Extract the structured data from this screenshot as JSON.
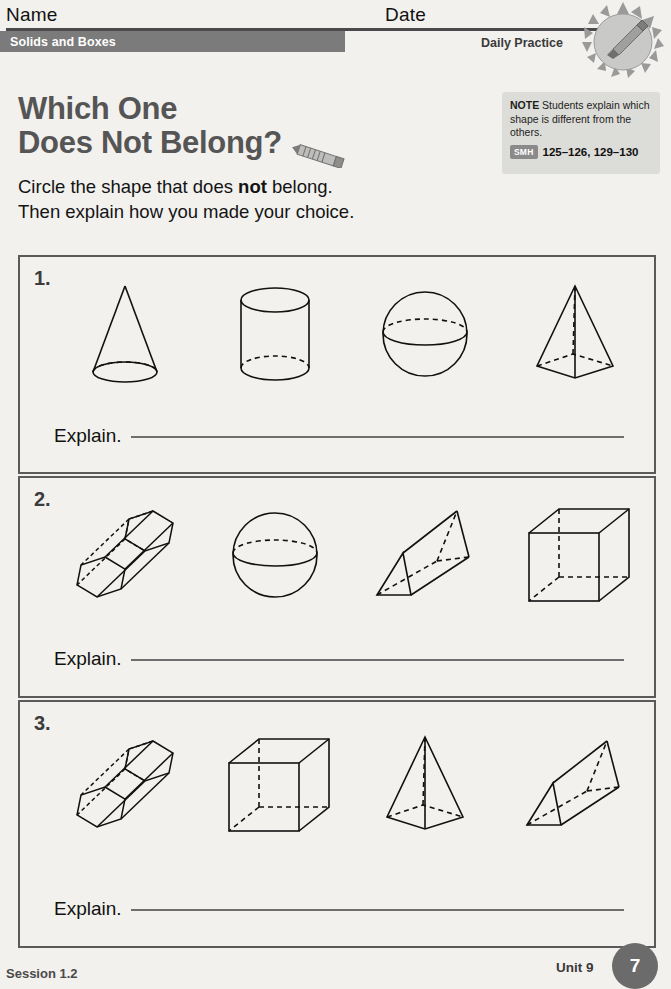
{
  "header": {
    "name_label": "Name",
    "date_label": "Date",
    "banner_title": "Solids and Boxes",
    "daily_practice": "Daily Practice",
    "badge_icon": "sun-pencil-badge-icon"
  },
  "title": {
    "line1": "Which One",
    "line2": "Does Not Belong?",
    "pencil_icon": "pencil-icon"
  },
  "instructions": {
    "line1_pre": "Circle the shape that does ",
    "line1_bold": "not",
    "line1_post": " belong.",
    "line2": "Then explain how you made your choice."
  },
  "note": {
    "label": "NOTE",
    "text": " Students explain which shape is different from the others.",
    "smh_badge": "SMH",
    "smh_pages": "125–126, 129–130"
  },
  "problems": [
    {
      "number": "1.",
      "shapes": [
        "cone",
        "cylinder",
        "sphere",
        "square-pyramid"
      ],
      "explain_label": "Explain."
    },
    {
      "number": "2.",
      "shapes": [
        "hexagonal-prism",
        "sphere",
        "triangular-prism",
        "cube"
      ],
      "explain_label": "Explain."
    },
    {
      "number": "3.",
      "shapes": [
        "hexagonal-prism",
        "cube",
        "square-pyramid",
        "triangular-prism"
      ],
      "explain_label": "Explain."
    }
  ],
  "footer": {
    "session": "Session 1.2",
    "unit": "Unit 9",
    "page_number": "7"
  },
  "colors": {
    "banner_gray": "#7b7b7b",
    "title_gray": "#555555",
    "note_bg": "#dcdcd8",
    "page_bg": "#f2f1ee",
    "rule": "#4a4a4a"
  }
}
